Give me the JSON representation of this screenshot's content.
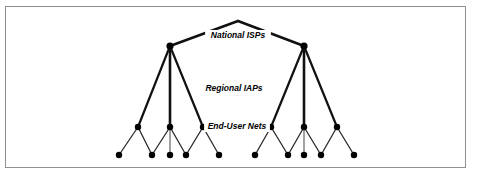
{
  "figure": {
    "background_color": "#ffffff",
    "frame_color": "#8f8f8f",
    "node_color": "#000000",
    "edge_color_primary": "#111111",
    "edge_color_secondary": "#2a2a2a",
    "edge_color_stub": "#8a8a8a"
  },
  "tiers": [
    {
      "id": "national-isps",
      "label": "National ISPs",
      "label_x": 238,
      "label_y": 38
    },
    {
      "id": "regional-iaps",
      "label": "Regional IAPs",
      "label_x": 234,
      "label_y": 91
    },
    {
      "id": "end-user-nets",
      "label": "End-User Nets",
      "label_y": 129,
      "label_x": 237
    }
  ],
  "nodes": {
    "apex": {
      "x": 238,
      "y": 21,
      "visible": false
    },
    "national": [
      {
        "id": "isp-left",
        "x": 170,
        "y": 46,
        "r": 3.6
      },
      {
        "id": "isp-right",
        "x": 304,
        "y": 46,
        "r": 3.6
      }
    ],
    "regional": [
      {
        "id": "iap-l1",
        "x": 138,
        "y": 127,
        "r": 3.2
      },
      {
        "id": "iap-l2",
        "x": 170,
        "y": 127,
        "r": 3.2
      },
      {
        "id": "iap-l3",
        "x": 203,
        "y": 127,
        "r": 3.2
      },
      {
        "id": "iap-r1",
        "x": 271,
        "y": 127,
        "r": 3.2
      },
      {
        "id": "iap-r2",
        "x": 304,
        "y": 127,
        "r": 3.2
      },
      {
        "id": "iap-r3",
        "x": 337,
        "y": 127,
        "r": 3.2
      }
    ],
    "enduser": [
      {
        "id": "eu-1",
        "x": 119,
        "y": 155,
        "r": 3.2
      },
      {
        "id": "eu-2",
        "x": 152,
        "y": 155,
        "r": 3.2
      },
      {
        "id": "eu-3",
        "x": 170,
        "y": 155,
        "r": 3.2
      },
      {
        "id": "eu-4",
        "x": 186,
        "y": 155,
        "r": 3.2
      },
      {
        "id": "eu-5",
        "x": 219,
        "y": 155,
        "r": 3.2
      },
      {
        "id": "eu-6",
        "x": 255,
        "y": 155,
        "r": 3.2
      },
      {
        "id": "eu-7",
        "x": 288,
        "y": 155,
        "r": 3.2
      },
      {
        "id": "eu-8",
        "x": 304,
        "y": 155,
        "r": 3.2
      },
      {
        "id": "eu-9",
        "x": 321,
        "y": 155,
        "r": 3.2
      },
      {
        "id": "eu-10",
        "x": 354,
        "y": 155,
        "r": 3.2
      }
    ]
  },
  "edges": {
    "top": [
      {
        "from": "apex",
        "to": "isp-left",
        "x1": 238,
        "y1": 21,
        "x2": 170,
        "y2": 46,
        "w": 2.6
      },
      {
        "from": "apex",
        "to": "isp-right",
        "x1": 238,
        "y1": 21,
        "x2": 304,
        "y2": 46,
        "w": 2.6
      }
    ],
    "middle": [
      {
        "from": "isp-left",
        "to": "iap-l1",
        "x1": 170,
        "y1": 46,
        "x2": 138,
        "y2": 127,
        "w": 2.2
      },
      {
        "from": "isp-left",
        "to": "iap-l2",
        "x1": 170,
        "y1": 46,
        "x2": 170,
        "y2": 127,
        "w": 2.6
      },
      {
        "from": "isp-left",
        "to": "iap-l3",
        "x1": 170,
        "y1": 46,
        "x2": 203,
        "y2": 127,
        "w": 2.2
      },
      {
        "from": "isp-right",
        "to": "iap-r1",
        "x1": 304,
        "y1": 46,
        "x2": 271,
        "y2": 127,
        "w": 2.2
      },
      {
        "from": "isp-right",
        "to": "iap-r2",
        "x1": 304,
        "y1": 46,
        "x2": 304,
        "y2": 127,
        "w": 2.6
      },
      {
        "from": "isp-right",
        "to": "iap-r3",
        "x1": 304,
        "y1": 46,
        "x2": 337,
        "y2": 127,
        "w": 2.2
      }
    ],
    "bottom": [
      {
        "from": "iap-l1",
        "to": "eu-1",
        "x1": 138,
        "y1": 127,
        "x2": 119,
        "y2": 155,
        "w": 1.3
      },
      {
        "from": "iap-l1",
        "to": "eu-2",
        "x1": 138,
        "y1": 127,
        "x2": 152,
        "y2": 155,
        "w": 1.3
      },
      {
        "from": "iap-l2",
        "to": "eu-2",
        "x1": 170,
        "y1": 127,
        "x2": 152,
        "y2": 155,
        "w": 1.3
      },
      {
        "from": "iap-l2",
        "to": "eu-4",
        "x1": 170,
        "y1": 127,
        "x2": 186,
        "y2": 155,
        "w": 1.3
      },
      {
        "from": "iap-l3",
        "to": "eu-4",
        "x1": 203,
        "y1": 127,
        "x2": 186,
        "y2": 155,
        "w": 1.3
      },
      {
        "from": "iap-l3",
        "to": "eu-5",
        "x1": 203,
        "y1": 127,
        "x2": 219,
        "y2": 155,
        "w": 1.3
      },
      {
        "from": "iap-r1",
        "to": "eu-6",
        "x1": 271,
        "y1": 127,
        "x2": 255,
        "y2": 155,
        "w": 1.3
      },
      {
        "from": "iap-r1",
        "to": "eu-7",
        "x1": 271,
        "y1": 127,
        "x2": 288,
        "y2": 155,
        "w": 1.3
      },
      {
        "from": "iap-r2",
        "to": "eu-7",
        "x1": 304,
        "y1": 127,
        "x2": 288,
        "y2": 155,
        "w": 1.3
      },
      {
        "from": "iap-r2",
        "to": "eu-9",
        "x1": 304,
        "y1": 127,
        "x2": 321,
        "y2": 155,
        "w": 1.3
      },
      {
        "from": "iap-r3",
        "to": "eu-9",
        "x1": 337,
        "y1": 127,
        "x2": 321,
        "y2": 155,
        "w": 1.3
      },
      {
        "from": "iap-r3",
        "to": "eu-10",
        "x1": 337,
        "y1": 127,
        "x2": 354,
        "y2": 155,
        "w": 1.3
      }
    ],
    "stubs": [
      {
        "from": "iap-l2",
        "to": "eu-3",
        "x1": 170,
        "y1": 127,
        "x2": 170,
        "y2": 155,
        "w": 1.6
      },
      {
        "from": "iap-r2",
        "to": "eu-8",
        "x1": 304,
        "y1": 127,
        "x2": 304,
        "y2": 155,
        "w": 1.6
      }
    ]
  }
}
